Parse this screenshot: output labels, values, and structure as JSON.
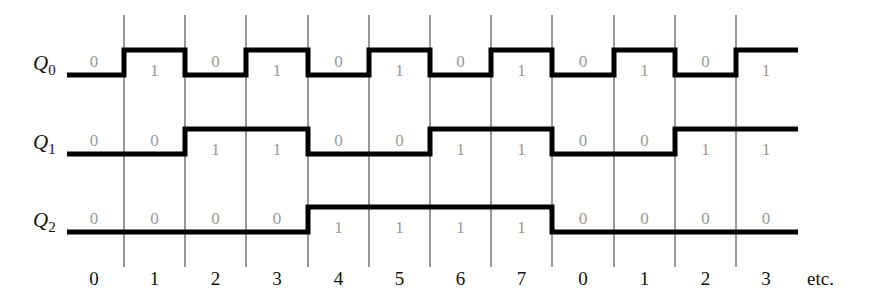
{
  "diagram": {
    "type": "timing_diagram",
    "signals": [
      {
        "name": "Q",
        "subscript": "0",
        "bits": [
          0,
          1,
          0,
          1,
          0,
          1,
          0,
          1,
          0,
          1,
          0,
          1
        ]
      },
      {
        "name": "Q",
        "subscript": "1",
        "bits": [
          0,
          0,
          1,
          1,
          0,
          0,
          1,
          1,
          0,
          0,
          1,
          1
        ]
      },
      {
        "name": "Q",
        "subscript": "2",
        "bits": [
          0,
          0,
          0,
          0,
          1,
          1,
          1,
          1,
          0,
          0,
          0,
          0
        ]
      }
    ],
    "clock_labels": [
      "0",
      "1",
      "2",
      "3",
      "4",
      "5",
      "6",
      "7",
      "0",
      "1",
      "2",
      "3"
    ],
    "trailing_label": "etc.",
    "colors": {
      "waveform": "#000000",
      "bit_text": "#9a9a9a",
      "grid": "#333333"
    }
  }
}
